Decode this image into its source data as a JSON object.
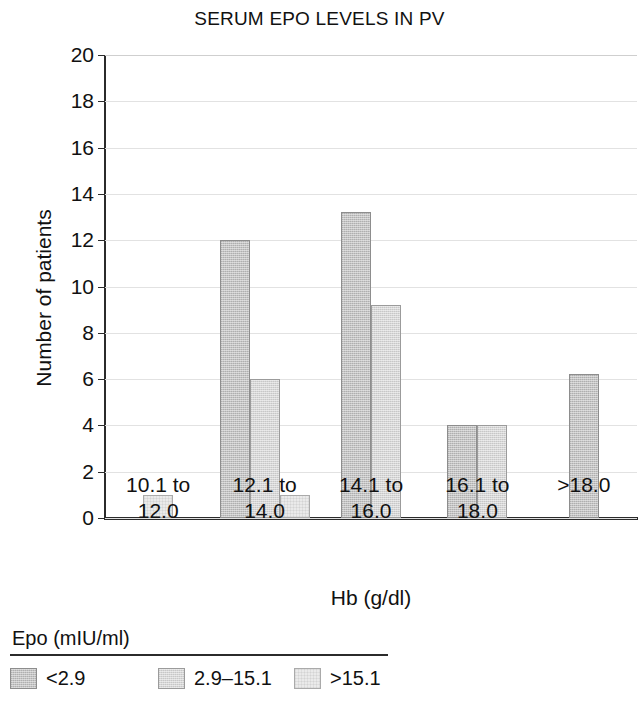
{
  "chart_data": {
    "type": "bar",
    "title": "SERUM EPO LEVELS IN PV",
    "xlabel": "Hb (g/dl)",
    "ylabel": "Number of patients",
    "ylim": [
      0,
      20
    ],
    "ytick_step": 2,
    "yticks": [
      "0",
      "2",
      "4",
      "6",
      "8",
      "10",
      "12",
      "14",
      "16",
      "18",
      "20"
    ],
    "grid": true,
    "grid_axis": "y",
    "legend_position": "below-plot",
    "legend_title": "Epo (mIU/ml)",
    "categories": [
      "10.1 to 12.0",
      "12.1 to 14.0",
      "14.1 to 16.0",
      "16.1 to 18.0",
      ">18.0"
    ],
    "series": [
      {
        "name": "<2.9",
        "color": "#c3c3c3",
        "values": [
          0,
          12,
          13.2,
          4,
          6.2
        ]
      },
      {
        "name": "2.9–15.1",
        "color": "#d6d6d6",
        "values": [
          0,
          6,
          9.2,
          4,
          0
        ]
      },
      {
        "name": ">15.1",
        "color": "#eaeaea",
        "values": [
          1,
          1,
          0,
          0,
          0
        ]
      }
    ]
  }
}
